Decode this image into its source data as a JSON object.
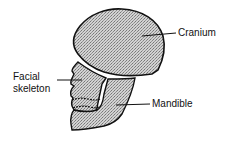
{
  "diagram": {
    "labels": {
      "cranium": "Cranium",
      "facial_line1": "Facial",
      "facial_line2": "skeleton",
      "mandible": "Mandible"
    },
    "colors": {
      "outline": "#111111",
      "fill": "#bdbdbd",
      "background": "#ffffff"
    }
  }
}
